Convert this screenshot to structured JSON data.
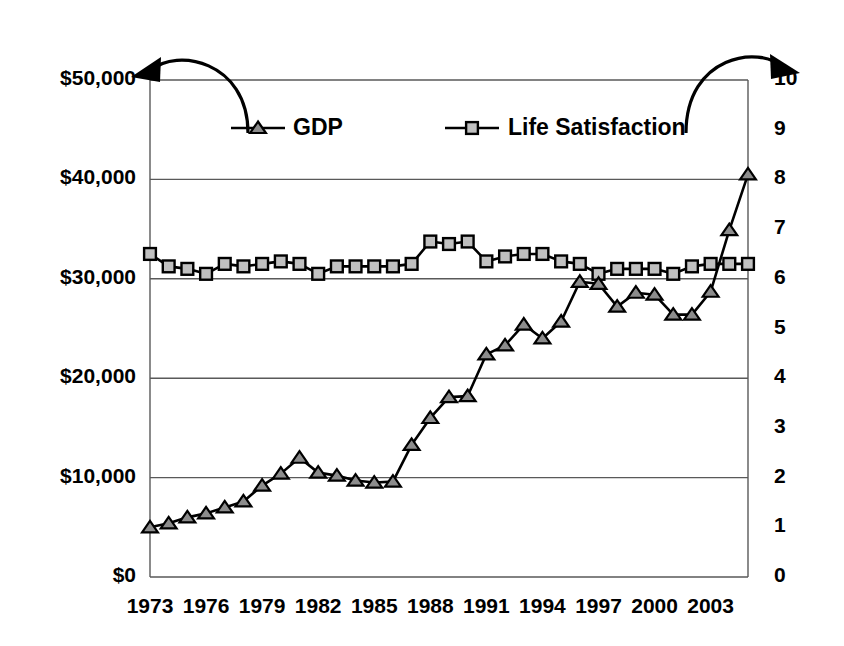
{
  "chart_data": {
    "type": "line",
    "title": "",
    "subtitle": "",
    "xlabel": "",
    "ylabel": "",
    "grid": true,
    "legend_position": "top-inside",
    "x": [
      1973,
      1974,
      1975,
      1976,
      1977,
      1978,
      1979,
      1980,
      1981,
      1982,
      1983,
      1984,
      1985,
      1986,
      1987,
      1988,
      1989,
      1990,
      1991,
      1992,
      1993,
      1994,
      1995,
      1996,
      1997,
      1998,
      1999,
      2000,
      2001,
      2002,
      2003,
      2004,
      2005
    ],
    "x_tick_labels": [
      "1973",
      "1976",
      "1979",
      "1982",
      "1985",
      "1988",
      "1991",
      "1994",
      "1997",
      "2000",
      "2003"
    ],
    "x_tick_values": [
      1973,
      1976,
      1979,
      1982,
      1985,
      1988,
      1991,
      1994,
      1997,
      2000,
      2003
    ],
    "axes": {
      "left": {
        "label": "GDP",
        "ylim": [
          0,
          50000
        ],
        "ticks": [
          0,
          10000,
          20000,
          30000,
          40000,
          50000
        ],
        "tick_labels": [
          "$0",
          "$10,000",
          "$20,000",
          "$30,000",
          "$40,000",
          "$50,000"
        ]
      },
      "right": {
        "label": "Life Satisfaction",
        "ylim": [
          0,
          10
        ],
        "ticks": [
          0,
          1,
          2,
          3,
          4,
          5,
          6,
          7,
          8,
          9,
          10
        ],
        "tick_labels": [
          "0",
          "1",
          "2",
          "3",
          "4",
          "5",
          "6",
          "7",
          "8",
          "9",
          "10"
        ]
      }
    },
    "series": [
      {
        "name": "GDP",
        "axis": "left",
        "marker": "triangle",
        "marker_fill": "#8c8c8c",
        "line_color": "#000000",
        "values": [
          5000,
          5400,
          6000,
          6400,
          7000,
          7600,
          9200,
          10400,
          12000,
          10500,
          10200,
          9700,
          9500,
          9600,
          13300,
          16000,
          18100,
          18200,
          22400,
          23300,
          25400,
          24000,
          25700,
          29700,
          29500,
          27200,
          28600,
          28400,
          26400,
          26400,
          28700,
          34900,
          40500
        ]
      },
      {
        "name": "Life Satisfaction",
        "axis": "right",
        "marker": "square",
        "marker_fill": "#c0c0c0",
        "line_color": "#000000",
        "values": [
          6.5,
          6.25,
          6.2,
          6.1,
          6.3,
          6.25,
          6.3,
          6.35,
          6.3,
          6.1,
          6.25,
          6.25,
          6.25,
          6.25,
          6.3,
          6.75,
          6.7,
          6.75,
          6.35,
          6.45,
          6.5,
          6.5,
          6.35,
          6.3,
          6.1,
          6.2,
          6.2,
          6.2,
          6.1,
          6.25,
          6.3,
          6.3,
          6.3
        ]
      }
    ],
    "annotations": [
      {
        "name": "gdp-axis-arrow",
        "from_series": "GDP",
        "points_to": "left-axis",
        "direction": "left"
      },
      {
        "name": "life-satisfaction-axis-arrow",
        "from_series": "Life Satisfaction",
        "points_to": "right-axis",
        "direction": "right"
      }
    ]
  },
  "legend": {
    "items": [
      {
        "label": "GDP",
        "marker": "triangle"
      },
      {
        "label": "Life Satisfaction",
        "marker": "square"
      }
    ]
  },
  "colors": {
    "line": "#000000",
    "grid": "#595959",
    "gdp_marker_fill": "#8c8c8c",
    "life_marker_fill": "#c0c0c0",
    "background": "#ffffff"
  }
}
